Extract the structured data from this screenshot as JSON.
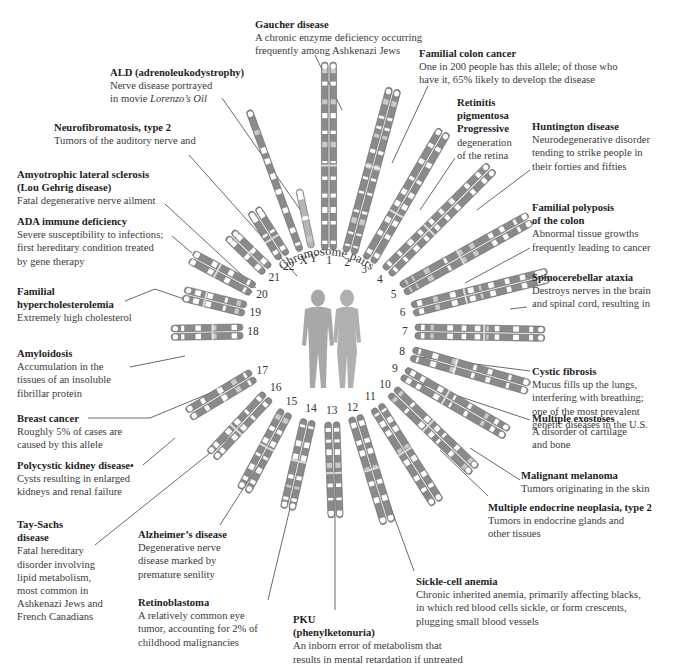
{
  "center": {
    "x": 329,
    "y": 330
  },
  "arc_title": "Chromosome pairs",
  "colors": {
    "chromosome": "#8a8a8a",
    "band_light": "#ffffff",
    "band_pale": "#c9c9c9",
    "leader": "#444444",
    "figure": "#a8a8a8",
    "text": "#2a2a2a"
  },
  "chromosomes": [
    {
      "id": "1",
      "angle": -90,
      "r0": 80,
      "len": 188,
      "label_r": 70
    },
    {
      "id": "2",
      "angle": -75,
      "r0": 80,
      "len": 170,
      "label_r": 70
    },
    {
      "id": "3",
      "angle": -60,
      "r0": 80,
      "len": 150,
      "label_r": 70
    },
    {
      "id": "4",
      "angle": -45,
      "r0": 82,
      "len": 148,
      "label_r": 72
    },
    {
      "id": "5",
      "angle": -29,
      "r0": 84,
      "len": 146,
      "label_r": 74
    },
    {
      "id": "6",
      "angle": -14,
      "r0": 86,
      "len": 140,
      "label_r": 76
    },
    {
      "id": "7",
      "angle": 1,
      "r0": 86,
      "len": 130,
      "label_r": 76
    },
    {
      "id": "8",
      "angle": 16,
      "r0": 86,
      "len": 122,
      "label_r": 76
    },
    {
      "id": "9",
      "angle": 30,
      "r0": 86,
      "len": 120,
      "label_r": 76
    },
    {
      "id": "10",
      "angle": 44,
      "r0": 88,
      "len": 114,
      "label_r": 78
    },
    {
      "id": "11",
      "angle": 58,
      "r0": 90,
      "len": 114,
      "label_r": 78
    },
    {
      "id": "12",
      "angle": 73,
      "r0": 90,
      "len": 112,
      "label_r": 80
    },
    {
      "id": "13",
      "angle": 88,
      "r0": 92,
      "len": 96,
      "label_r": 80
    },
    {
      "id": "14",
      "angle": 103,
      "r0": 92,
      "len": 92,
      "label_r": 80
    },
    {
      "id": "15",
      "angle": 118,
      "r0": 92,
      "len": 90,
      "label_r": 80
    },
    {
      "id": "16",
      "angle": 133,
      "r0": 90,
      "len": 82,
      "label_r": 78
    },
    {
      "id": "17",
      "angle": 149,
      "r0": 88,
      "len": 76,
      "label_r": 78
    },
    {
      "id": "18",
      "angle": 179,
      "r0": 86,
      "len": 72,
      "label_r": 76
    },
    {
      "id": "19",
      "angle": -166,
      "r0": 86,
      "len": 64,
      "label_r": 76
    },
    {
      "id": "20",
      "angle": -152,
      "r0": 86,
      "len": 70,
      "label_r": 76
    },
    {
      "id": "21",
      "angle": -136,
      "r0": 86,
      "len": 52,
      "label_r": 76
    },
    {
      "id": "22",
      "angle": -122,
      "r0": 86,
      "len": 56,
      "label_r": 76
    },
    {
      "id": "X",
      "angle": -110,
      "r0": 84,
      "len": 150,
      "label_r": 74,
      "single": true
    },
    {
      "id": "Y",
      "angle": -102,
      "r0": 84,
      "len": 60,
      "label_r": 74,
      "single": true,
      "pale": true
    }
  ],
  "annotations": [
    {
      "key": "gaucher",
      "title": "Gaucher disease",
      "lines": [
        "A chronic enzyme deficiency occurring",
        "frequently among Ashkenazi Jews"
      ],
      "x": 255,
      "y": 18,
      "leader": [
        [
          315,
          55
        ],
        [
          342,
          110
        ]
      ]
    },
    {
      "key": "colon-cancer",
      "title": "Familial colon cancer",
      "lines": [
        "One in 200 people has this allele; of those who",
        "have it, 65% likely to develop the disease"
      ],
      "x": 419,
      "y": 47,
      "leader": [
        [
          428,
          86
        ],
        [
          392,
          163
        ]
      ]
    },
    {
      "key": "ald",
      "title": "ALD (adrenoleukodystrophy)",
      "lines": [
        "Nerve disease portrayed",
        "in movie <i>Lorenzo’s Oil</i>"
      ],
      "x": 110,
      "y": 66,
      "leader": [
        [
          222,
          98
        ],
        [
          306,
          218
        ]
      ]
    },
    {
      "key": "retinitis",
      "title": "Retinitis",
      "lines": [
        "pigmentosa",
        "Progressive",
        "degeneration",
        "of the retina"
      ],
      "bold_lines": 2,
      "x": 457,
      "y": 96,
      "leader": [
        [
          455,
          158
        ],
        [
          420,
          210
        ]
      ]
    },
    {
      "key": "huntington",
      "title": "Huntington disease",
      "lines": [
        "Neurodegenerative disorder",
        "tending to strike people in",
        "their forties and fifties"
      ],
      "x": 532,
      "y": 120,
      "leader": [
        [
          530,
          170
        ],
        [
          477,
          210
        ]
      ]
    },
    {
      "key": "nf2",
      "title": "Neurofibromatosis, type 2",
      "lines": [
        "Tumors of the auditory nerve and"
      ],
      "x": 54,
      "y": 121,
      "leader": [
        [
          189,
          155
        ],
        [
          297,
          276
        ]
      ]
    },
    {
      "key": "als",
      "title": "Amyotrophic lateral sclerosis",
      "lines": [
        "(Lou Gehrig disease)",
        "Fatal degenerative nerve ailment"
      ],
      "bold_lines": 1,
      "x": 17,
      "y": 168,
      "leader": [
        [
          165,
          204
        ],
        [
          256,
          288
        ]
      ]
    },
    {
      "key": "polyposis",
      "title": "Familial polyposis",
      "lines": [
        "of the colon",
        "Abnormal tissue growths",
        "frequently leading to cancer"
      ],
      "bold_lines": 1,
      "x": 532,
      "y": 201,
      "leader": [
        [
          530,
          248
        ],
        [
          465,
          283
        ]
      ]
    },
    {
      "key": "ada",
      "title": "ADA immune deficiency",
      "lines": [
        "Severe susceptibility to infections;",
        "first hereditary condition treated",
        "by gene therapy"
      ],
      "x": 17,
      "y": 215,
      "leader": [
        [
          172,
          236
        ],
        [
          192,
          253
        ]
      ]
    },
    {
      "key": "spinocerebellar",
      "title": "Spinocerebellar ataxia",
      "lines": [
        "Destroys nerves in the brain",
        "and spinal cord, resulting in"
      ],
      "x": 532,
      "y": 271,
      "leader": [
        [
          527,
          307
        ],
        [
          510,
          309
        ]
      ]
    },
    {
      "key": "fh",
      "title": "Familial",
      "lines": [
        "hypercholesterolemia",
        "Extremely high cholesterol"
      ],
      "bold_lines": 1,
      "x": 17,
      "y": 285,
      "leader": [
        [
          125,
          301
        ],
        [
          155,
          289
        ],
        [
          184,
          299
        ]
      ]
    },
    {
      "key": "amyloidosis",
      "title": "Amyloidosis",
      "lines": [
        "Accumulation in the",
        "tissues of an insoluble",
        "fibrillar protein"
      ],
      "x": 17,
      "y": 347,
      "leader": [
        [
          130,
          367
        ],
        [
          185,
          356
        ]
      ]
    },
    {
      "key": "cystic-fibrosis",
      "title": "Cystic fibrosis",
      "lines": [
        "Mucus fills up the lungs,",
        "interfering with breathing;",
        "one of the most prevalent",
        "genetic diseases in the U.S."
      ],
      "x": 532,
      "y": 365,
      "leader": [
        [
          530,
          371
        ],
        [
          420,
          357
        ]
      ]
    },
    {
      "key": "breast-cancer",
      "title": "Breast cancer",
      "lines": [
        "Roughly 5% of cases are",
        "caused by this allele"
      ],
      "x": 17,
      "y": 412,
      "leader": [
        [
          88,
          418
        ],
        [
          150,
          418
        ],
        [
          215,
          391
        ]
      ]
    },
    {
      "key": "exostoses",
      "title": "Multiple exostoses",
      "lines": [
        "A disorder of cartilage",
        "and bone"
      ],
      "x": 532,
      "y": 412,
      "leader": [
        [
          530,
          420
        ],
        [
          410,
          380
        ]
      ]
    },
    {
      "key": "polycystic",
      "title": "Polycystic kidney disease•",
      "lines": [
        "Cysts resulting in enlarged",
        "kidneys and renal failure"
      ],
      "x": 17,
      "y": 459,
      "leader": [
        [
          143,
          465
        ],
        [
          175,
          438
        ]
      ]
    },
    {
      "key": "melanoma",
      "title": "Malignant melanoma",
      "lines": [
        "Tumors originating in the skin"
      ],
      "x": 521,
      "y": 469,
      "leader": [
        [
          520,
          480
        ],
        [
          470,
          448
        ]
      ]
    },
    {
      "key": "men2",
      "title": "Multiple endocrine neoplasia, type 2",
      "lines": [
        "Tumors in endocrine glands and",
        "other tissues"
      ],
      "x": 488,
      "y": 501,
      "leader": [
        [
          488,
          496
        ],
        [
          440,
          450
        ]
      ]
    },
    {
      "key": "tay-sachs",
      "title": "Tay-Sachs",
      "lines": [
        "disease",
        "Fatal hereditary",
        "disorder involving",
        "lipid metabolism,",
        "most common in",
        "Ashkenazi Jews and",
        "French Canadians"
      ],
      "bold_lines": 1,
      "x": 17,
      "y": 518,
      "leader": [
        [
          95,
          545
        ],
        [
          245,
          425
        ]
      ]
    },
    {
      "key": "alzheimers",
      "title": "Alzheimer’s disease",
      "lines": [
        "Degenerative nerve",
        "disease marked by",
        "premature senility"
      ],
      "x": 138,
      "y": 528,
      "leader": [
        [
          220,
          525
        ],
        [
          277,
          436
        ]
      ]
    },
    {
      "key": "sickle-cell",
      "title": "Sickle-cell anemia",
      "lines": [
        "Chronic inherited anemia, primarily affecting blacks,",
        "in which red blood cells sickle, or form crescents,",
        "plugging small blood vessels"
      ],
      "x": 416,
      "y": 575,
      "leader": [
        [
          414,
          571
        ],
        [
          372,
          456
        ]
      ]
    },
    {
      "key": "retinoblastoma",
      "title": "Retinoblastoma",
      "lines": [
        "A relatively common eye",
        "tumor, accounting for 2% of",
        "childhood malignancies"
      ],
      "x": 138,
      "y": 596,
      "leader": [
        [
          268,
          600
        ],
        [
          302,
          458
        ]
      ]
    },
    {
      "key": "pku",
      "title": "PKU",
      "lines": [
        "(phenylketonuria)",
        "An inborn error of metabolism that",
        "results in mental retardation if untreated"
      ],
      "bold_lines": 1,
      "x": 293,
      "y": 613,
      "leader": [
        [
          335,
          610
        ],
        [
          335,
          455
        ]
      ]
    }
  ]
}
